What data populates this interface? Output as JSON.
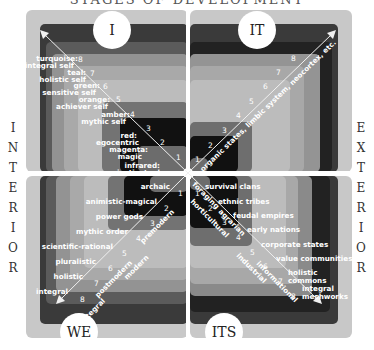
{
  "title": "STAGES OF DEVELOPMENT",
  "side_labels": {
    "left": "INTERIOR",
    "right": "EXTERIOR"
  },
  "quadrants": {
    "upper_left": {
      "badge": "I",
      "levels": [
        {
          "n": "1",
          "label": "infrared: instinctual"
        },
        {
          "n": "2",
          "label": "magenta: magic"
        },
        {
          "n": "3",
          "label": "red: egocentric"
        },
        {
          "n": "4",
          "label": "amber: mythic self"
        },
        {
          "n": "5",
          "label": "orange: achiever self"
        },
        {
          "n": "6",
          "label": "green: sensitive self"
        },
        {
          "n": "7",
          "label": "teal: holistic self"
        },
        {
          "n": "8",
          "label": "turquoise: integral self"
        }
      ]
    },
    "upper_right": {
      "badge": "IT",
      "axis_label": "organic states, limbic system, neocortex, etc.",
      "levels": [
        "1",
        "2",
        "3",
        "4",
        "5",
        "6",
        "7",
        "8"
      ]
    },
    "lower_left": {
      "badge": "WE",
      "levels": [
        {
          "n": "1",
          "label": "archaic"
        },
        {
          "n": "2",
          "label": "animistic-magical"
        },
        {
          "n": "3",
          "label": "power gods"
        },
        {
          "n": "4",
          "label": "mythic order"
        },
        {
          "n": "5",
          "label": "scientific-rational"
        },
        {
          "n": "6",
          "label": "pluralistic"
        },
        {
          "n": "7",
          "label": "holistic"
        },
        {
          "n": "8",
          "label": "integral"
        }
      ],
      "axis_labels": [
        "premodern",
        "modern",
        "postmodern",
        "integral"
      ]
    },
    "lower_right": {
      "badge": "ITS",
      "levels": [
        {
          "n": "1",
          "label": "survival clans"
        },
        {
          "n": "2",
          "label": "ethnic tribes"
        },
        {
          "n": "3",
          "label": "feudal empires"
        },
        {
          "n": "4",
          "label": "early nations"
        },
        {
          "n": "5",
          "label": "corporate states"
        },
        {
          "n": "6",
          "label": "value communities"
        },
        {
          "n": "7",
          "label": "holistic commons"
        },
        {
          "n": "8",
          "label": "integral meshworks"
        }
      ],
      "axis_labels": [
        "foraging",
        "horticultural",
        "agrarian",
        "industrial",
        "informational"
      ]
    }
  },
  "colors": {
    "outer_frame": "#c8c8c8",
    "band_8": "#3a3a3a",
    "band_7": "#5a5a5a",
    "band_6": "#a0a0a0",
    "band_5": "#b8b8b8",
    "band_4": "#8a8a8a",
    "band_3": "#555555",
    "band_2": "#1a1a1a",
    "band_1": "#6a6a6a"
  }
}
